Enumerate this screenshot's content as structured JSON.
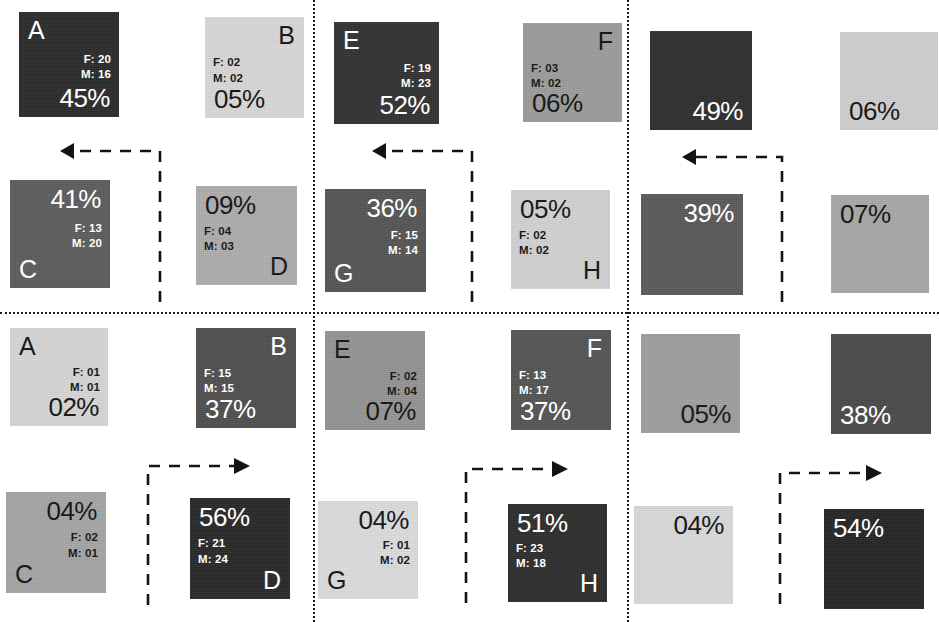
{
  "figure": {
    "type": "grid-of-heatmap-matrices",
    "panel_columns": 3,
    "panel_rows": 2,
    "cells_per_panel": 4,
    "legend_keys": {
      "female_prefix": "F:",
      "male_prefix": "M:"
    }
  },
  "dividers": {
    "vertical": [
      313,
      627
    ],
    "horizontal": [
      312
    ]
  },
  "panels": [
    {
      "id": "panel-top-left",
      "labelled": true,
      "arrow": {
        "direction": "left",
        "style": "dashed"
      },
      "cells": [
        {
          "id": "tl-A",
          "label": "A",
          "label_pos": "tl",
          "female": "F: 20",
          "male": "M: 16",
          "percent": "45%",
          "fill": "#2b2b2b",
          "text_color": "#ffffff",
          "value": 45,
          "pct_pos": "br",
          "fm_pos": "cr"
        },
        {
          "id": "tl-B",
          "label": "B",
          "label_pos": "tr",
          "female": "F: 02",
          "male": "M: 02",
          "percent": "05%",
          "fill": "#d8d8d8",
          "text_color": "#1a1a1a",
          "value": 5,
          "pct_pos": "bl",
          "fm_pos": "cl"
        },
        {
          "id": "tl-C",
          "label": "C",
          "label_pos": "bl",
          "female": "F: 13",
          "male": "M: 20",
          "percent": "41%",
          "fill": "#5d5d5d",
          "text_color": "#ffffff",
          "value": 41,
          "pct_pos": "tr",
          "fm_pos": "cr"
        },
        {
          "id": "tl-D",
          "label": "D",
          "label_pos": "br",
          "female": "F: 04",
          "male": "M: 03",
          "percent": "09%",
          "fill": "#adadad",
          "text_color": "#1a1a1a",
          "value": 9,
          "pct_pos": "tl",
          "fm_pos": "cl"
        }
      ]
    },
    {
      "id": "panel-top-middle",
      "labelled": true,
      "arrow": {
        "direction": "left",
        "style": "dashed"
      },
      "cells": [
        {
          "id": "tm-E",
          "label": "E",
          "label_pos": "tl",
          "female": "F: 19",
          "male": "M: 23",
          "percent": "52%",
          "fill": "#323232",
          "text_color": "#ffffff",
          "value": 52,
          "pct_pos": "br",
          "fm_pos": "cr"
        },
        {
          "id": "tm-F",
          "label": "F",
          "label_pos": "tr",
          "female": "F: 03",
          "male": "M: 02",
          "percent": "06%",
          "fill": "#9c9c9c",
          "text_color": "#1a1a1a",
          "value": 6,
          "pct_pos": "bl",
          "fm_pos": "cl"
        },
        {
          "id": "tm-G",
          "label": "G",
          "label_pos": "bl",
          "female": "F: 15",
          "male": "M: 14",
          "percent": "36%",
          "fill": "#555555",
          "text_color": "#ffffff",
          "value": 36,
          "pct_pos": "tr",
          "fm_pos": "cr"
        },
        {
          "id": "tm-H",
          "label": "H",
          "label_pos": "br",
          "female": "F: 02",
          "male": "M: 02",
          "percent": "05%",
          "fill": "#d2d2d2",
          "text_color": "#1a1a1a",
          "value": 5,
          "pct_pos": "tl",
          "fm_pos": "cl"
        }
      ]
    },
    {
      "id": "panel-top-right",
      "labelled": false,
      "arrow": {
        "direction": "left",
        "style": "dashed"
      },
      "cells": [
        {
          "id": "tr-1",
          "label": "",
          "label_pos": "tl",
          "female": "",
          "male": "",
          "percent": "49%",
          "fill": "#2e2e2e",
          "text_color": "#ffffff",
          "value": 49,
          "pct_pos": "br",
          "fm_pos": "cr"
        },
        {
          "id": "tr-2",
          "label": "",
          "label_pos": "tr",
          "female": "",
          "male": "",
          "percent": "06%",
          "fill": "#cfcfcf",
          "text_color": "#1a1a1a",
          "value": 6,
          "pct_pos": "bl",
          "fm_pos": "cl"
        },
        {
          "id": "tr-3",
          "label": "",
          "label_pos": "bl",
          "female": "",
          "male": "",
          "percent": "39%",
          "fill": "#5a5a5a",
          "text_color": "#ffffff",
          "value": 39,
          "pct_pos": "tr",
          "fm_pos": "cr"
        },
        {
          "id": "tr-4",
          "label": "",
          "label_pos": "br",
          "female": "",
          "male": "",
          "percent": "07%",
          "fill": "#a8a8a8",
          "text_color": "#1a1a1a",
          "value": 7,
          "pct_pos": "tl",
          "fm_pos": "cl"
        }
      ]
    },
    {
      "id": "panel-bottom-left",
      "labelled": true,
      "arrow": {
        "direction": "right",
        "style": "dashed"
      },
      "cells": [
        {
          "id": "bl-A",
          "label": "A",
          "label_pos": "tl",
          "female": "F: 01",
          "male": "M: 01",
          "percent": "02%",
          "fill": "#d6d6d6",
          "text_color": "#1a1a1a",
          "value": 2,
          "pct_pos": "br",
          "fm_pos": "cr"
        },
        {
          "id": "bl-B",
          "label": "B",
          "label_pos": "tr",
          "female": "F: 15",
          "male": "M: 15",
          "percent": "37%",
          "fill": "#4f4f4f",
          "text_color": "#ffffff",
          "value": 37,
          "pct_pos": "bl",
          "fm_pos": "cl"
        },
        {
          "id": "bl-C",
          "label": "C",
          "label_pos": "bl",
          "female": "F: 02",
          "male": "M: 01",
          "percent": "04%",
          "fill": "#a5a5a5",
          "text_color": "#1a1a1a",
          "value": 4,
          "pct_pos": "tr",
          "fm_pos": "cr"
        },
        {
          "id": "bl-D",
          "label": "D",
          "label_pos": "br",
          "female": "F: 21",
          "male": "M: 24",
          "percent": "56%",
          "fill": "#282828",
          "text_color": "#ffffff",
          "value": 56,
          "pct_pos": "tl",
          "fm_pos": "cl"
        }
      ]
    },
    {
      "id": "panel-bottom-middle",
      "labelled": true,
      "arrow": {
        "direction": "right",
        "style": "dashed"
      },
      "cells": [
        {
          "id": "bm-E",
          "label": "E",
          "label_pos": "tl",
          "female": "F: 02",
          "male": "M: 04",
          "percent": "07%",
          "fill": "#949494",
          "text_color": "#1a1a1a",
          "value": 7,
          "pct_pos": "br",
          "fm_pos": "cr"
        },
        {
          "id": "bm-F",
          "label": "F",
          "label_pos": "tr",
          "female": "F: 13",
          "male": "M: 17",
          "percent": "37%",
          "fill": "#545454",
          "text_color": "#ffffff",
          "value": 37,
          "pct_pos": "bl",
          "fm_pos": "cl"
        },
        {
          "id": "bm-G",
          "label": "G",
          "label_pos": "bl",
          "female": "F: 01",
          "male": "M: 02",
          "percent": "04%",
          "fill": "#dcdcdc",
          "text_color": "#1a1a1a",
          "value": 4,
          "pct_pos": "tr",
          "fm_pos": "cr"
        },
        {
          "id": "bm-H",
          "label": "H",
          "label_pos": "br",
          "female": "F: 23",
          "male": "M: 18",
          "percent": "51%",
          "fill": "#2d2d2d",
          "text_color": "#ffffff",
          "value": 51,
          "pct_pos": "tl",
          "fm_pos": "cl"
        }
      ]
    },
    {
      "id": "panel-bottom-right",
      "labelled": false,
      "arrow": {
        "direction": "right",
        "style": "dashed"
      },
      "cells": [
        {
          "id": "br-1",
          "label": "",
          "label_pos": "tl",
          "female": "",
          "male": "",
          "percent": "05%",
          "fill": "#9e9e9e",
          "text_color": "#1a1a1a",
          "value": 5,
          "pct_pos": "br",
          "fm_pos": "cr"
        },
        {
          "id": "br-2",
          "label": "",
          "label_pos": "tr",
          "female": "",
          "male": "",
          "percent": "38%",
          "fill": "#4a4a4a",
          "text_color": "#ffffff",
          "value": 38,
          "pct_pos": "bl",
          "fm_pos": "cl"
        },
        {
          "id": "br-3",
          "label": "",
          "label_pos": "bl",
          "female": "",
          "male": "",
          "percent": "04%",
          "fill": "#d9d9d9",
          "text_color": "#1a1a1a",
          "value": 4,
          "pct_pos": "tr",
          "fm_pos": "cr"
        },
        {
          "id": "br-4",
          "label": "",
          "label_pos": "br",
          "female": "",
          "male": "",
          "percent": "54%",
          "fill": "#252525",
          "text_color": "#ffffff",
          "value": 54,
          "pct_pos": "tl",
          "fm_pos": "cl"
        }
      ]
    }
  ],
  "geometry": {
    "cells": [
      {
        "x": 19,
        "y": 12,
        "w": 100,
        "h": 105
      },
      {
        "x": 205,
        "y": 17,
        "w": 99,
        "h": 101
      },
      {
        "x": 10,
        "y": 180,
        "w": 100,
        "h": 108
      },
      {
        "x": 196,
        "y": 186,
        "w": 101,
        "h": 99
      },
      {
        "x": 334,
        "y": 22,
        "w": 105,
        "h": 102
      },
      {
        "x": 523,
        "y": 23,
        "w": 99,
        "h": 99
      },
      {
        "x": 325,
        "y": 189,
        "w": 101,
        "h": 103
      },
      {
        "x": 511,
        "y": 190,
        "w": 99,
        "h": 99
      },
      {
        "x": 650,
        "y": 31,
        "w": 102,
        "h": 99
      },
      {
        "x": 840,
        "y": 32,
        "w": 98,
        "h": 98
      },
      {
        "x": 641,
        "y": 194,
        "w": 102,
        "h": 101
      },
      {
        "x": 831,
        "y": 195,
        "w": 98,
        "h": 98
      },
      {
        "x": 10,
        "y": 328,
        "w": 98,
        "h": 98
      },
      {
        "x": 196,
        "y": 328,
        "w": 100,
        "h": 100
      },
      {
        "x": 6,
        "y": 492,
        "w": 100,
        "h": 101
      },
      {
        "x": 190,
        "y": 498,
        "w": 100,
        "h": 101
      },
      {
        "x": 325,
        "y": 331,
        "w": 100,
        "h": 99
      },
      {
        "x": 511,
        "y": 330,
        "w": 100,
        "h": 100
      },
      {
        "x": 318,
        "y": 501,
        "w": 100,
        "h": 98
      },
      {
        "x": 508,
        "y": 504,
        "w": 99,
        "h": 98
      },
      {
        "x": 641,
        "y": 334,
        "w": 99,
        "h": 99
      },
      {
        "x": 831,
        "y": 334,
        "w": 100,
        "h": 100
      },
      {
        "x": 634,
        "y": 506,
        "w": 99,
        "h": 98
      },
      {
        "x": 824,
        "y": 509,
        "w": 100,
        "h": 100
      }
    ],
    "arrows": [
      {
        "x": 60,
        "y": 140,
        "w": 108,
        "h": 162,
        "dir": "left"
      },
      {
        "x": 372,
        "y": 140,
        "w": 108,
        "h": 162,
        "dir": "left"
      },
      {
        "x": 682,
        "y": 146,
        "w": 108,
        "h": 156,
        "dir": "left"
      },
      {
        "x": 140,
        "y": 455,
        "w": 112,
        "h": 150,
        "dir": "right"
      },
      {
        "x": 458,
        "y": 458,
        "w": 112,
        "h": 145,
        "dir": "right"
      },
      {
        "x": 772,
        "y": 462,
        "w": 112,
        "h": 142,
        "dir": "right"
      }
    ]
  }
}
